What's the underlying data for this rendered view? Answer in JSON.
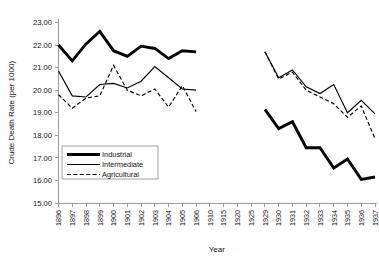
{
  "chart_data": {
    "type": "line",
    "title": "",
    "xlabel": "Year",
    "ylabel": "Crude Death Rate (per 1000)",
    "ylim": [
      15.0,
      23.0
    ],
    "ytick_step": 1.0,
    "ytick_labels": [
      "15.00",
      "16.00",
      "17.00",
      "18.00",
      "19.00",
      "20.00",
      "21.00",
      "22.00",
      "23.00"
    ],
    "grid": false,
    "legend_position": "inside-lower-left",
    "categories": [
      "1896",
      "1897",
      "1898",
      "1899",
      "1900",
      "1901",
      "1902",
      "1903",
      "1904",
      "1905",
      "1906",
      "1910",
      "1915",
      "1920",
      "1925",
      "1929",
      "1930",
      "1931",
      "1932",
      "1933",
      "1934",
      "1935",
      "1936",
      "1937"
    ],
    "series": [
      {
        "name": "Industrial",
        "style": "thick-solid",
        "color": "#000000",
        "values": [
          22.0,
          21.3,
          22.05,
          22.6,
          21.75,
          21.5,
          21.95,
          21.85,
          21.4,
          21.75,
          21.7,
          null,
          null,
          null,
          null,
          19.15,
          18.3,
          18.6,
          17.45,
          17.45,
          16.55,
          16.95,
          16.05,
          16.15
        ]
      },
      {
        "name": "Intermediate",
        "style": "thin-solid",
        "color": "#000000",
        "values": [
          20.85,
          19.75,
          19.7,
          20.25,
          20.3,
          20.1,
          20.4,
          21.05,
          20.55,
          20.05,
          20.0,
          null,
          null,
          null,
          null,
          21.7,
          20.55,
          20.9,
          20.15,
          19.85,
          20.25,
          19.0,
          19.55,
          18.95
        ]
      },
      {
        "name": "Agricultural",
        "style": "dashed",
        "color": "#000000",
        "values": [
          19.8,
          19.2,
          19.65,
          19.75,
          21.1,
          20.0,
          19.75,
          20.05,
          19.25,
          20.2,
          19.05,
          null,
          null,
          null,
          null,
          21.7,
          20.5,
          20.8,
          20.0,
          19.7,
          19.4,
          18.8,
          19.3,
          17.85
        ]
      }
    ]
  },
  "legend": {
    "entries": [
      {
        "label": "Industrial",
        "style": "thick-solid"
      },
      {
        "label": "Intermediate",
        "style": "thin-solid"
      },
      {
        "label": "Agricultural",
        "style": "dashed"
      }
    ]
  }
}
